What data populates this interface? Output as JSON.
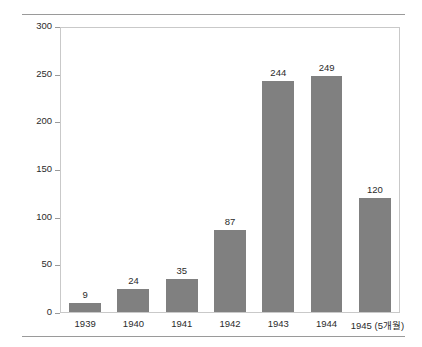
{
  "chart_data": {
    "type": "bar",
    "title": "",
    "subtitle": "",
    "xlabel": "",
    "ylabel": "유보트 손실량",
    "categories": [
      "1939",
      "1940",
      "1941",
      "1942",
      "1943",
      "1944",
      "1945 (5개월)"
    ],
    "values": [
      9,
      24,
      35,
      87,
      244,
      249,
      120
    ],
    "value_labels": [
      "9",
      "24",
      "35",
      "87",
      "244",
      "249",
      "120"
    ],
    "ylim": [
      0,
      300
    ],
    "yticks": [
      0,
      50,
      100,
      150,
      200,
      250,
      300
    ],
    "ytick_labels": [
      "0",
      "50",
      "100",
      "150",
      "200",
      "250",
      "300"
    ],
    "grid": false,
    "legend": null,
    "legend_position": "none",
    "series": [
      {
        "name": "유보트 손실량",
        "values": [
          9,
          24,
          35,
          87,
          244,
          249,
          120
        ],
        "color": "#808080"
      }
    ],
    "colors": {
      "bar": "#808080",
      "axis": "#c9c9c9",
      "tick": "#9a9a9a",
      "rule": "#9a9a9a",
      "text": "#2b2b2b",
      "background": "#ffffff"
    }
  }
}
